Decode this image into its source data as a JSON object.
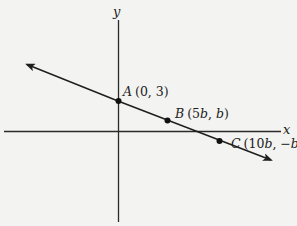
{
  "diagram": {
    "type": "coordinate-plane",
    "axes": {
      "x_label": "x",
      "y_label": "y"
    },
    "line": {
      "description": "line with arrows at both ends, negative slope",
      "color": "#1e1e1e"
    },
    "points": [
      {
        "name": "A",
        "coords": "(0, 3)",
        "label": "A (0, 3)"
      },
      {
        "name": "B",
        "coords": "(5b, b)",
        "label": "B (5b, b)"
      },
      {
        "name": "C",
        "coords": "(10b, −b)",
        "label": "C (10b, −b)"
      }
    ]
  },
  "labels": {
    "x_axis": "x",
    "y_axis": "y",
    "A_name": "A",
    "A_coords": "(0, 3)",
    "B_name": "B",
    "B_open": "(5",
    "B_b1": "b",
    "B_mid": ", ",
    "B_b2": "b",
    "B_close": ")",
    "C_name": "C",
    "C_open": "(10",
    "C_b1": "b",
    "C_mid": ", −",
    "C_b2": "b",
    "C_close": ")"
  }
}
